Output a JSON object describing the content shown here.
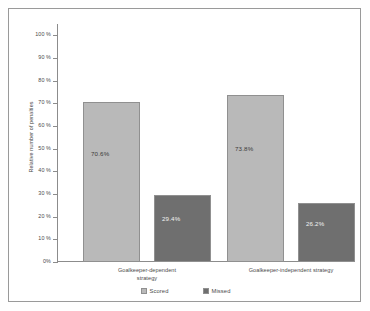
{
  "chart_data": {
    "type": "bar",
    "title": "",
    "xlabel": "",
    "ylabel": "Relative number of penalties",
    "ylim": [
      0,
      105
    ],
    "grid": false,
    "legend_position": "bottom-center",
    "categories": [
      "Goalkeeper-dependent strategy",
      "Goalkeeper-independent strategy"
    ],
    "series": [
      {
        "name": "Scored",
        "color": "#b9b9b9",
        "values": [
          70.6,
          73.8
        ]
      },
      {
        "name": "Missed",
        "color": "#6f6f6f",
        "values": [
          29.4,
          26.2
        ]
      }
    ],
    "data_labels": [
      "70.6%",
      "29.4%",
      "73.8%",
      "26.2%"
    ],
    "y_ticks": [
      {
        "value": 100,
        "label": "100 %"
      },
      {
        "value": 90,
        "label": "90 %"
      },
      {
        "value": 80,
        "label": "80 %"
      },
      {
        "value": 70,
        "label": "70 %"
      },
      {
        "value": 60,
        "label": "60 %"
      },
      {
        "value": 50,
        "label": "50 %"
      },
      {
        "value": 40,
        "label": "40 %"
      },
      {
        "value": 30,
        "label": "30 %"
      },
      {
        "value": 20,
        "label": "20 %"
      },
      {
        "value": 10,
        "label": "10 %"
      },
      {
        "value": 0,
        "label": "0%"
      }
    ],
    "category_label_lines": [
      [
        "Goalkeeper-dependent",
        "strategy"
      ],
      [
        "Goalkeeper-independent strategy"
      ]
    ],
    "legend": [
      {
        "label": "Scored",
        "swatch": "scored"
      },
      {
        "label": "Missed",
        "swatch": "missed"
      }
    ],
    "colors": {
      "scored": "#b9b9b9",
      "missed": "#6f6f6f",
      "axis": "#8c8c8c",
      "frame": "#9a9a9a",
      "text": "#4a4a4a"
    }
  }
}
